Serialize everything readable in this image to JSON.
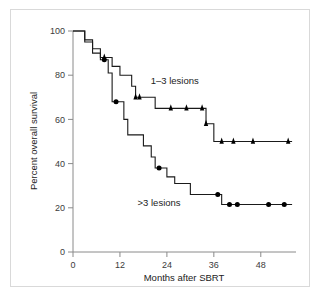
{
  "chart_data": {
    "type": "line",
    "title": "",
    "xlabel": "Months after SBRT",
    "ylabel": "Percent overall survival",
    "xlim": [
      0,
      57
    ],
    "ylim": [
      0,
      100
    ],
    "xticks": [
      0,
      12,
      24,
      36,
      48
    ],
    "xtick_labels": [
      "0",
      "12",
      "24",
      "36",
      "48"
    ],
    "yticks": [
      0,
      20,
      40,
      60,
      80,
      100
    ],
    "ytick_labels": [
      "0",
      "20",
      "40",
      "60",
      "80",
      "100"
    ],
    "grid": false,
    "legend_position": "inline-annotation",
    "series": [
      {
        "name": "1–3 lesions",
        "label": "1–3 lesions",
        "label_x": 26,
        "label_y": 76,
        "marker": "triangle",
        "steps": [
          {
            "x": 0,
            "y": 100
          },
          {
            "x": 3,
            "y": 100
          },
          {
            "x": 3,
            "y": 96
          },
          {
            "x": 5,
            "y": 96
          },
          {
            "x": 5,
            "y": 92
          },
          {
            "x": 7,
            "y": 92
          },
          {
            "x": 7,
            "y": 88
          },
          {
            "x": 10,
            "y": 88
          },
          {
            "x": 10,
            "y": 84
          },
          {
            "x": 12,
            "y": 84
          },
          {
            "x": 12,
            "y": 80
          },
          {
            "x": 15,
            "y": 80
          },
          {
            "x": 15,
            "y": 75
          },
          {
            "x": 16,
            "y": 75
          },
          {
            "x": 16,
            "y": 70
          },
          {
            "x": 21,
            "y": 70
          },
          {
            "x": 21,
            "y": 65
          },
          {
            "x": 34,
            "y": 65
          },
          {
            "x": 34,
            "y": 58
          },
          {
            "x": 36,
            "y": 58
          },
          {
            "x": 36,
            "y": 50
          },
          {
            "x": 56,
            "y": 50
          }
        ],
        "censored": [
          {
            "x": 8,
            "y": 88
          },
          {
            "x": 16,
            "y": 70
          },
          {
            "x": 17,
            "y": 70
          },
          {
            "x": 25,
            "y": 65
          },
          {
            "x": 29,
            "y": 65
          },
          {
            "x": 33,
            "y": 65
          },
          {
            "x": 34,
            "y": 58
          },
          {
            "x": 38,
            "y": 50
          },
          {
            "x": 41,
            "y": 50
          },
          {
            "x": 46,
            "y": 50
          },
          {
            "x": 55,
            "y": 50
          }
        ]
      },
      {
        "name": ">3 lesions",
        "label": ">3 lesions",
        "label_x": 22,
        "label_y": 21,
        "marker": "circle",
        "steps": [
          {
            "x": 0,
            "y": 100
          },
          {
            "x": 3,
            "y": 100
          },
          {
            "x": 3,
            "y": 95
          },
          {
            "x": 5,
            "y": 95
          },
          {
            "x": 5,
            "y": 90
          },
          {
            "x": 7,
            "y": 90
          },
          {
            "x": 7,
            "y": 87
          },
          {
            "x": 9,
            "y": 87
          },
          {
            "x": 9,
            "y": 81
          },
          {
            "x": 10,
            "y": 81
          },
          {
            "x": 10,
            "y": 68
          },
          {
            "x": 13,
            "y": 68
          },
          {
            "x": 13,
            "y": 60
          },
          {
            "x": 14,
            "y": 60
          },
          {
            "x": 14,
            "y": 53
          },
          {
            "x": 18,
            "y": 53
          },
          {
            "x": 18,
            "y": 48
          },
          {
            "x": 20,
            "y": 48
          },
          {
            "x": 20,
            "y": 43
          },
          {
            "x": 21,
            "y": 43
          },
          {
            "x": 21,
            "y": 38
          },
          {
            "x": 24,
            "y": 38
          },
          {
            "x": 24,
            "y": 34
          },
          {
            "x": 26,
            "y": 34
          },
          {
            "x": 26,
            "y": 31
          },
          {
            "x": 30,
            "y": 31
          },
          {
            "x": 30,
            "y": 26
          },
          {
            "x": 38,
            "y": 26
          },
          {
            "x": 38,
            "y": 21.5
          },
          {
            "x": 56,
            "y": 21.5
          }
        ],
        "censored": [
          {
            "x": 8,
            "y": 87
          },
          {
            "x": 11,
            "y": 68
          },
          {
            "x": 22,
            "y": 38
          },
          {
            "x": 37,
            "y": 26
          },
          {
            "x": 40,
            "y": 21.5
          },
          {
            "x": 42,
            "y": 21.5
          },
          {
            "x": 50,
            "y": 21.5
          },
          {
            "x": 54,
            "y": 21.5
          }
        ]
      }
    ]
  },
  "colors": {
    "line": "#1a1a1a",
    "axis": "#8a8a8a",
    "text": "#222222",
    "frame": "#d9d9d9",
    "background": "#ffffff"
  }
}
